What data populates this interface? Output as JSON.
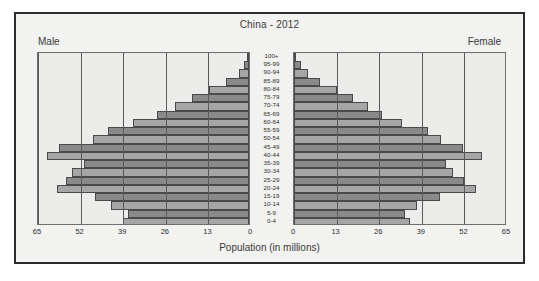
{
  "chart": {
    "title": "China - 2012",
    "left_label": "Male",
    "right_label": "Female",
    "axis_title": "Population (in millions)"
  },
  "chart_data": {
    "type": "bar",
    "subtype": "population-pyramid",
    "title": "China - 2012",
    "xlabel": "Population (in millions)",
    "ylabel": "",
    "xlim": [
      0,
      65
    ],
    "tick_values": [
      65,
      52,
      39,
      26,
      13,
      0
    ],
    "tick_values_right": [
      0,
      13,
      26,
      39,
      52,
      65
    ],
    "grid": true,
    "legend": [
      "Male",
      "Female"
    ],
    "legend_position": "top-corners",
    "categories": [
      "100+",
      "95-99",
      "90-94",
      "85-89",
      "80-84",
      "75-79",
      "70-74",
      "65-69",
      "60-64",
      "55-59",
      "50-54",
      "45-49",
      "40-44",
      "35-39",
      "30-34",
      "25-29",
      "20-24",
      "15-19",
      "10-14",
      "5-9",
      "0-4"
    ],
    "series": [
      {
        "name": "Male",
        "side": "left",
        "values": [
          0.4,
          1.4,
          3.2,
          7.0,
          12.2,
          17.5,
          22.5,
          28.0,
          35.5,
          43.0,
          47.5,
          58.0,
          61.5,
          50.5,
          54.0,
          56.0,
          58.5,
          47.0,
          42.0,
          37.0,
          38.5
        ]
      },
      {
        "name": "Female",
        "side": "right",
        "values": [
          0.6,
          2.0,
          4.2,
          8.0,
          13.0,
          18.0,
          22.5,
          27.0,
          33.0,
          41.0,
          45.0,
          51.5,
          57.5,
          46.5,
          48.5,
          52.0,
          55.5,
          44.5,
          37.5,
          34.0,
          35.5
        ]
      }
    ]
  }
}
